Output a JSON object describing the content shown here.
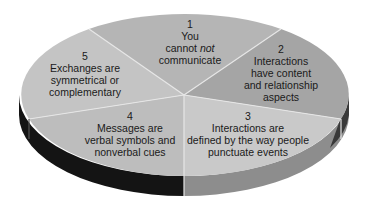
{
  "diagram": {
    "type": "3d-pie",
    "title": "",
    "colors": {
      "slice_1": "#b5b5b5",
      "slice_2": "#a5a5a5",
      "slice_3": "#c9c9c9",
      "slice_4": "#bdbdbd",
      "slice_5": "#c4c4c4",
      "side_left": "#141414",
      "side_right": "#8d8d8d",
      "divider": "#e6e6e6",
      "text": "#1a1a1a"
    },
    "slices": [
      {
        "number": "1",
        "lines": [
          "You",
          "cannot ",
          "communicate"
        ],
        "emphasis": "not",
        "text": "You cannot not communicate"
      },
      {
        "number": "2",
        "lines": [
          "Interactions",
          "have content",
          "and relationship",
          "aspects"
        ],
        "text": "Interactions have content and relationship aspects"
      },
      {
        "number": "3",
        "lines": [
          "Interactions are",
          "defined by the way people",
          "punctuate events"
        ],
        "text": "Interactions are defined by the way people punctuate events"
      },
      {
        "number": "4",
        "lines": [
          "Messages are",
          "verbal symbols and",
          "nonverbal cues"
        ],
        "text": "Messages are verbal symbols and nonverbal cues"
      },
      {
        "number": "5",
        "lines": [
          "Exchanges are",
          "symmetrical or",
          "complementary"
        ],
        "text": "Exchanges are symmetrical or complementary"
      }
    ]
  }
}
